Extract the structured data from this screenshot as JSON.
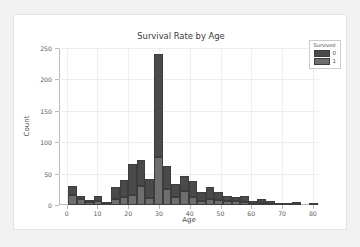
{
  "figure": {
    "background": "#ffffff",
    "page_background": "#f2f2f2"
  },
  "chart_data": {
    "type": "bar",
    "subtype": "stacked-histogram",
    "title": "Survival Rate by Age",
    "xlabel": "Age",
    "ylabel": "Count",
    "xlim": [
      -2.5,
      82
    ],
    "ylim": [
      0,
      250
    ],
    "grid": true,
    "xticks": [
      0,
      10,
      20,
      30,
      40,
      50,
      60,
      70,
      80
    ],
    "xtick_labels": [
      "0",
      "10",
      "20",
      "30",
      "40",
      "50",
      "60",
      "70",
      "80"
    ],
    "yticks": [
      0,
      50,
      100,
      150,
      200,
      250
    ],
    "ytick_labels": [
      "0",
      "50",
      "100",
      "150",
      "200",
      "250"
    ],
    "legend": {
      "title": "Survived",
      "position": "upper-right",
      "entries": [
        {
          "label": "0",
          "color": "#4a4a4a"
        },
        {
          "label": "1",
          "color": "#6e6e6e"
        }
      ]
    },
    "bin_width": 2.8,
    "bins": [
      {
        "x": 0.4,
        "survived_1": 16,
        "survived_0": 14
      },
      {
        "x": 3.2,
        "survived_1": 9,
        "survived_0": 5
      },
      {
        "x": 6.0,
        "survived_1": 5,
        "survived_0": 3
      },
      {
        "x": 8.8,
        "survived_1": 7,
        "survived_0": 7
      },
      {
        "x": 11.6,
        "survived_1": 2,
        "survived_0": 1
      },
      {
        "x": 14.4,
        "survived_1": 9,
        "survived_0": 20
      },
      {
        "x": 17.2,
        "survived_1": 12,
        "survived_0": 28
      },
      {
        "x": 20.0,
        "survived_1": 16,
        "survived_0": 49
      },
      {
        "x": 22.8,
        "survived_1": 30,
        "survived_0": 42
      },
      {
        "x": 25.6,
        "survived_1": 11,
        "survived_0": 31
      },
      {
        "x": 28.4,
        "survived_1": 77,
        "survived_0": 164
      },
      {
        "x": 31.2,
        "survived_1": 26,
        "survived_0": 36
      },
      {
        "x": 34.0,
        "survived_1": 12,
        "survived_0": 21
      },
      {
        "x": 36.8,
        "survived_1": 22,
        "survived_0": 25
      },
      {
        "x": 39.6,
        "survived_1": 12,
        "survived_0": 26
      },
      {
        "x": 42.4,
        "survived_1": 6,
        "survived_0": 14
      },
      {
        "x": 45.2,
        "survived_1": 9,
        "survived_0": 19
      },
      {
        "x": 48.0,
        "survived_1": 8,
        "survived_0": 12
      },
      {
        "x": 50.8,
        "survived_1": 7,
        "survived_0": 8
      },
      {
        "x": 53.6,
        "survived_1": 6,
        "survived_0": 7
      },
      {
        "x": 56.4,
        "survived_1": 5,
        "survived_0": 9
      },
      {
        "x": 59.2,
        "survived_1": 2,
        "survived_0": 4
      },
      {
        "x": 62.0,
        "survived_1": 3,
        "survived_0": 6
      },
      {
        "x": 64.8,
        "survived_1": 1,
        "survived_0": 5
      },
      {
        "x": 67.6,
        "survived_1": 0,
        "survived_0": 3
      },
      {
        "x": 70.4,
        "survived_1": 0,
        "survived_0": 1
      },
      {
        "x": 73.2,
        "survived_1": 1,
        "survived_0": 3
      },
      {
        "x": 76.0,
        "survived_1": 0,
        "survived_0": 0
      },
      {
        "x": 78.8,
        "survived_1": 0,
        "survived_0": 1
      }
    ]
  }
}
